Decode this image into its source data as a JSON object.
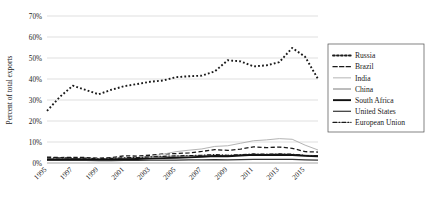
{
  "chart_data": {
    "type": "line",
    "title": "",
    "xlabel": "",
    "ylabel": "Percent of total exports",
    "xlim": [
      1995,
      2016
    ],
    "ylim": [
      0,
      70
    ],
    "y_tick_labels": [
      "0%",
      "10%",
      "20%",
      "30%",
      "40%",
      "50%",
      "60%",
      "70%"
    ],
    "y_ticks": [
      0,
      10,
      20,
      30,
      40,
      50,
      60,
      70
    ],
    "x_tick_labels": [
      "1995",
      "1997",
      "1999",
      "2001",
      "2003",
      "2005",
      "2007",
      "2009",
      "2011",
      "2013",
      "2015"
    ],
    "x_ticks": [
      1995,
      1997,
      1999,
      2001,
      2003,
      2005,
      2007,
      2009,
      2011,
      2013,
      2015
    ],
    "x": [
      1995,
      1996,
      1997,
      1998,
      1999,
      2000,
      2001,
      2002,
      2003,
      2004,
      2005,
      2006,
      2007,
      2008,
      2009,
      2010,
      2011,
      2012,
      2013,
      2014,
      2015,
      2016
    ],
    "grid": "horizontal",
    "legend_position": "right",
    "series": [
      {
        "name": "Russia",
        "style": "dotted",
        "color": "#1a1a1a",
        "width": 1.9,
        "values": [
          24.8,
          31.5,
          36.8,
          34.8,
          32.7,
          34.9,
          36.6,
          37.6,
          38.7,
          39.3,
          40.9,
          41.3,
          41.6,
          43.6,
          48.9,
          48.4,
          46.0,
          46.5,
          48.0,
          54.8,
          50.6,
          40.0
        ]
      },
      {
        "name": "Brazil",
        "style": "dashed",
        "color": "#1a1a1a",
        "width": 1.3,
        "values": [
          2.8,
          2.6,
          2.7,
          2.6,
          2.3,
          2.6,
          3.4,
          3.3,
          3.7,
          4.3,
          4.5,
          4.8,
          5.5,
          6.4,
          6.0,
          6.6,
          7.7,
          7.3,
          7.6,
          7.0,
          5.4,
          5.2
        ]
      },
      {
        "name": "India",
        "style": "solid",
        "color": "#b4b4b4",
        "width": 1.0,
        "values": [
          1.6,
          1.7,
          1.8,
          1.7,
          1.7,
          2.0,
          2.2,
          2.6,
          3.1,
          4.2,
          5.4,
          6.1,
          6.7,
          7.9,
          8.2,
          9.4,
          10.6,
          11.0,
          11.6,
          11.3,
          8.5,
          6.2
        ]
      },
      {
        "name": "China",
        "style": "solid",
        "color": "#7a7a7a",
        "width": 1.0,
        "values": [
          1.9,
          1.9,
          2.0,
          2.0,
          2.0,
          2.2,
          2.4,
          2.6,
          2.9,
          3.1,
          3.3,
          3.4,
          3.6,
          3.8,
          3.6,
          3.8,
          4.0,
          4.1,
          4.2,
          4.1,
          3.7,
          3.5
        ]
      },
      {
        "name": "South Africa",
        "style": "solid",
        "color": "#111111",
        "width": 1.9,
        "values": [
          1.7,
          1.7,
          1.8,
          1.7,
          1.6,
          1.7,
          1.8,
          1.9,
          2.1,
          2.3,
          2.5,
          2.7,
          3.0,
          3.3,
          3.2,
          3.6,
          3.9,
          3.8,
          3.9,
          3.8,
          3.4,
          3.2
        ]
      },
      {
        "name": "United States",
        "style": "solid",
        "color": "#333333",
        "width": 1.2,
        "values": [
          1.2,
          1.2,
          1.2,
          1.2,
          1.1,
          1.1,
          1.2,
          1.2,
          1.3,
          1.4,
          1.4,
          1.5,
          1.5,
          1.6,
          1.5,
          1.6,
          1.7,
          1.7,
          1.7,
          1.7,
          1.5,
          1.4
        ]
      },
      {
        "name": "European Union",
        "style": "dashdot",
        "color": "#1a1a1a",
        "width": 1.2,
        "values": [
          2.5,
          2.4,
          2.4,
          2.3,
          2.1,
          2.2,
          2.5,
          2.6,
          2.9,
          3.2,
          3.4,
          3.5,
          3.7,
          4.0,
          3.7,
          4.0,
          4.3,
          4.2,
          4.3,
          4.2,
          3.6,
          3.4
        ]
      }
    ]
  },
  "legend": {
    "items": [
      {
        "label": "Russia"
      },
      {
        "label": "Brazil"
      },
      {
        "label": "India"
      },
      {
        "label": "China"
      },
      {
        "label": "South Africa"
      },
      {
        "label": "United States"
      },
      {
        "label": "European Union"
      }
    ]
  }
}
